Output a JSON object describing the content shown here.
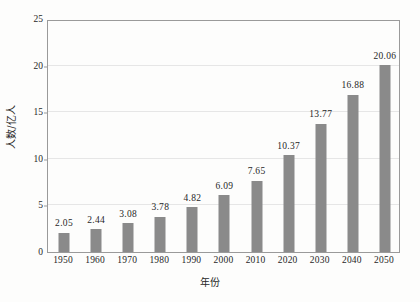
{
  "chart_data": {
    "type": "bar",
    "title": "",
    "subtitle": "",
    "categories": [
      "1950",
      "1960",
      "1970",
      "1980",
      "1990",
      "2000",
      "2010",
      "2020",
      "2030",
      "2040",
      "2050"
    ],
    "values": [
      2.05,
      2.44,
      3.08,
      3.78,
      4.82,
      6.09,
      7.65,
      10.37,
      13.77,
      16.88,
      20.06
    ],
    "value_labels": [
      "2.05",
      "2.44",
      "3.08",
      "3.78",
      "4.82",
      "6.09",
      "7.65",
      "10.37",
      "13.77",
      "16.88",
      "20.06"
    ],
    "xlabel": "年份",
    "ylabel": "人数/亿人",
    "ylim": [
      0,
      25
    ],
    "yticks": [
      0,
      5,
      10,
      15,
      20,
      25
    ],
    "ytick_labels": [
      "0",
      "5",
      "10",
      "15",
      "20",
      "25"
    ],
    "grid": true,
    "grid_axis": "y",
    "legend": false,
    "legend_position": "none",
    "series_color": "#8a8a8a",
    "gridline_color": "#e6e6e6",
    "frame_color": "#9a9a9a",
    "background_color": "#fdfdfc",
    "text_color": "#272727"
  }
}
